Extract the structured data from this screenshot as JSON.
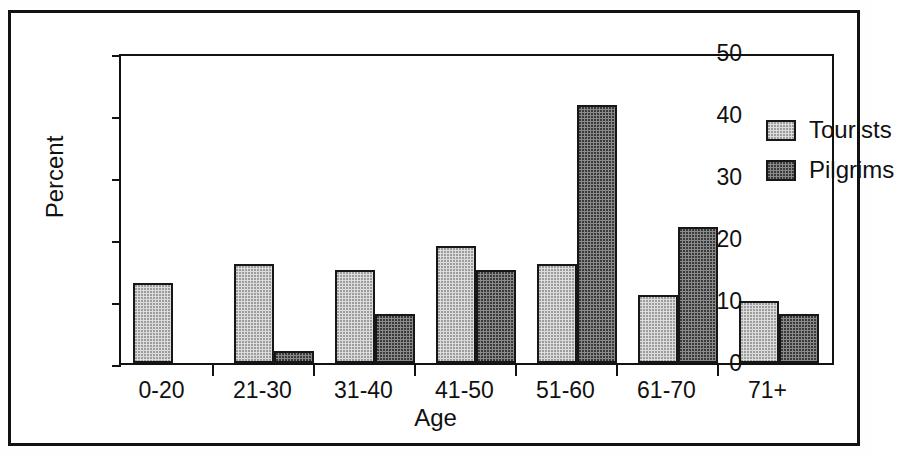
{
  "chart_data": {
    "type": "bar",
    "title": "",
    "xlabel": "Age",
    "ylabel": "Percent",
    "categories": [
      "0-20",
      "21-30",
      "31-40",
      "41-50",
      "51-60",
      "61-70",
      "71+"
    ],
    "series": [
      {
        "name": "Tourists",
        "values": [
          13,
          16,
          15,
          19,
          16,
          11,
          10
        ],
        "color": "#dcdcdc"
      },
      {
        "name": "Pilgrims",
        "values": [
          0,
          2,
          8,
          15,
          41.7,
          22,
          8
        ],
        "color": "#8a8a8a"
      }
    ],
    "ylim": [
      0,
      50
    ],
    "yticks": [
      0,
      10,
      20,
      30,
      40,
      50
    ],
    "ytick_labels": [
      "0",
      "10",
      "20",
      "30",
      "40",
      "50"
    ],
    "grid": false,
    "legend_position": "top-right",
    "legend": [
      "Tourists",
      "Pilgrims"
    ]
  },
  "axes": {
    "y_label": "Percent",
    "x_label": "Age",
    "y_ticks": [
      "50",
      "40",
      "30",
      "20",
      "10",
      "0"
    ],
    "x_ticks": [
      "0-20",
      "21-30",
      "31-40",
      "41-50",
      "51-60",
      "61-70",
      "71+"
    ]
  },
  "legend": {
    "items": [
      {
        "label": "Tourists",
        "swatch": "light-gray-dotted"
      },
      {
        "label": "Pilgrims",
        "swatch": "dark-gray-dotted"
      }
    ]
  }
}
